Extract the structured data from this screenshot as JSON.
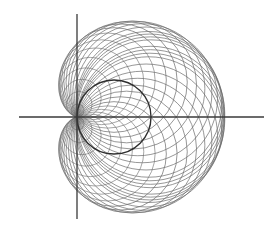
{
  "figure": {
    "colors": {
      "background": "#ffffff",
      "axis": "#3a3a3a",
      "base_circle": "#2e2e2e",
      "family_circles": "#6a6a6a"
    },
    "axes": {
      "origin": [
        77,
        117
      ],
      "x_axis": {
        "from": 19,
        "to": 264
      },
      "y_axis": {
        "from": 14,
        "to": 219
      }
    },
    "base_circle": {
      "center": [
        114,
        117
      ],
      "radius": 37
    },
    "family": {
      "cusp": [
        77,
        117
      ],
      "angles_deg": [
        -90,
        -80,
        -70,
        -60,
        -50,
        -40,
        -30,
        -20,
        -15,
        -10,
        -5,
        5,
        10,
        15,
        20,
        30,
        40,
        50,
        60,
        70,
        80,
        90
      ],
      "inner_angles_deg": [
        -170,
        -160,
        -150,
        -140,
        -130,
        -120,
        -110,
        -100,
        100,
        110,
        120,
        130,
        140,
        150,
        160,
        170
      ]
    }
  }
}
